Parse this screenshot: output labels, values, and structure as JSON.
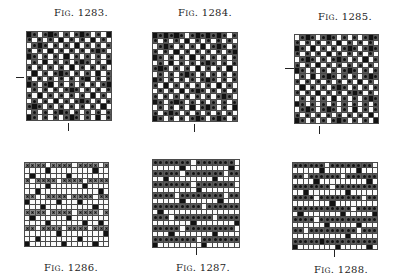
{
  "figures": [
    {
      "id": "1283",
      "caption_prefix": "F",
      "caption_sc": "IG",
      "caption_num": ". 1283.",
      "caption_pos": "top",
      "caption_xy": [
        54,
        7
      ],
      "grid": {
        "x": 26,
        "y": 31,
        "w": 86,
        "h": 90
      },
      "marks": [
        {
          "type": "h",
          "x": 16,
          "y": 77,
          "len": 8
        },
        {
          "type": "v",
          "x": 68,
          "y": 123,
          "len": 8
        }
      ],
      "rows": [
        "bdwdbdwdwdbdwdwb",
        "dwdwdwbwdwdwbwdw",
        "wdbdwdwdwbwdwdwd",
        "dwdwbwdwdwdwdbdw",
        "bdwdwdwbwdwdwdwd",
        "wdwbwdwdwdbdwdwb",
        "dwdwdwdwbwdwdwdw",
        "wbwdwdbdwdwdwbwd",
        "dwdwdwdwdwdbwdwd",
        "bdwdbwdwdwdwdwdb",
        "wdwdwdwdbdwdwdwd",
        "dwbwdwdwdwdwbwdw",
        "wdwdwbwdwdbdwdwd",
        "dbdwdwdwdwdwdwbw",
        "wdwdwdbdwdwdwdwd",
        "bdwdwdwdbdwdwbwd"
      ]
    },
    {
      "id": "1284",
      "caption_prefix": "F",
      "caption_sc": "IG",
      "caption_num": ". 1284.",
      "caption_pos": "top",
      "caption_xy": [
        178,
        7
      ],
      "grid": {
        "x": 152,
        "y": 32,
        "w": 86,
        "h": 90
      },
      "marks": [
        {
          "type": "v",
          "x": 194,
          "y": 124,
          "len": 8
        }
      ],
      "rows": [
        "bdbdbdwdbdbdbdwd",
        "dwdwdwbwdwdwdwdw",
        "wdbdwdwdwbwdbdwd",
        "dwdwbwdwdwdwdwdb",
        "bdwdwdwbwdwdwdwd",
        "wdwbwdwdwdbdwdwd",
        "dbdwdwdwbwdwdwbw",
        "wdwdwdbdwdwdwdwd",
        "bdwdwdwdwdbdwdwd",
        "dwbwdwdwdwdwbwdw",
        "wdwdwbwdbdwdwdwd",
        "dwdwdwdwdwdwdbdw",
        "bdwdbdwdwdwdwdwd",
        "wdwdwdwbwdbdwdwb",
        "dwdbdwdwdwdwdwdw",
        "bdwdwdwdbdwdbdwd"
      ]
    },
    {
      "id": "1285",
      "caption_prefix": "F",
      "caption_sc": "IG",
      "caption_num": ". 1285.",
      "caption_pos": "top",
      "caption_xy": [
        318,
        11
      ],
      "grid": {
        "x": 294,
        "y": 34,
        "w": 85,
        "h": 90
      },
      "marks": [
        {
          "type": "h",
          "x": 285,
          "y": 68,
          "len": 9
        },
        {
          "type": "v",
          "x": 319,
          "y": 126,
          "len": 8
        }
      ],
      "rows": [
        "wdbdwdbdwdwdwdbd",
        "dwdwdwdwbwdwdwdw",
        "bdwbwdwdwdbdwdbd",
        "dwdwdwbwdwdwdwdw",
        "wdbdwdwdbdwdwbwd",
        "dwdwbwdwdwdwdwdw",
        "bdwdwdwdwdbdwdwd",
        "wdwbwdbdwdwdwdbd",
        "dwdwdwdwdwdwbwdw",
        "wbwdwdwdbdwdwdwd",
        "dwdwbwdwdwdbdwdw",
        "wdwdwdwbwdwdwdbd",
        "bdwdwdwdwdwdwdwd",
        "wdbdwdbdwdwbwdwd",
        "dwdwdwdwdwdwdwbw",
        "bdwdwdwdbdwdwdwb"
      ]
    },
    {
      "id": "1286",
      "caption_prefix": "F",
      "caption_sc": "IG",
      "caption_num": ". 1286.",
      "caption_pos": "bottom",
      "caption_xy": [
        44,
        262
      ],
      "grid": {
        "x": 24,
        "y": 162,
        "w": 85,
        "h": 85
      },
      "marks": [],
      "rows": [
        "xxxxwxxxxwxxxxwx",
        "wwwwbwwwwwwwwbww",
        "wbwwwwwwbwwwwwww",
        "xwxxxxwxxxxwxxxx",
        "wwwwbwwwwwwbwwww",
        "wwbwwwwwwwwwwwbw",
        "xxwwxxxxwxxxxwxx",
        "bwwwwwbwwwbwwwww",
        "wwwbwwwwwwwwwbww",
        "xxxxwxxxxwxxxxwx",
        "wbwwwwwwbwwwwwww",
        "wwwwbwwwwwwbwwbw",
        "xxwxxxxwxxxxwxxx",
        "wwwwwwbwwwwwwwwb",
        "wwbwwwwwwwbwwwww",
        "bwwwwwwbwwwwwbww"
      ]
    },
    {
      "id": "1287",
      "caption_prefix": "F",
      "caption_sc": "IG",
      "caption_num": ". 1287.",
      "caption_pos": "bottom",
      "caption_xy": [
        176,
        262
      ],
      "grid": {
        "x": 152,
        "y": 159,
        "w": 88,
        "h": 89
      },
      "marks": [
        {
          "type": "v",
          "x": 196,
          "y": 248,
          "len": 7
        }
      ],
      "rows": [
        "dddddddwdddddddw",
        "wwwwwbwwwwwwwwbw",
        "dddddwdddddddwdd",
        "wwbwwwwwwwwbwwww",
        "dddddddwdddddddw",
        "wwwwwwwwbwwwwwww",
        "ddddwddddddddwdd",
        "wwwwwbwwwwwwbwww",
        "dddddddddwdddddd",
        "wbwwwwwwwwwwwwww",
        "dddwdddddddwdddd",
        "wwwwwwwbwwwwwwwb",
        "dddddwdddddddddw",
        "wwwbwwwwwwwbwwww",
        "ddddddddwddddddd",
        "bwwwwwwwwbwwwwww"
      ]
    },
    {
      "id": "1288",
      "caption_prefix": "F",
      "caption_sc": "IG",
      "caption_num": ". 1288.",
      "caption_pos": "bottom",
      "caption_xy": [
        314,
        264
      ],
      "grid": {
        "x": 292,
        "y": 162,
        "w": 86,
        "h": 88
      },
      "marks": [
        {
          "type": "v",
          "x": 334,
          "y": 250,
          "len": 7
        }
      ],
      "rows": [
        "ddddddwddddddddw",
        "wwwwwbwwwwwwbwww",
        "ddwddddddwdddddd",
        "wwwwbwwwwwwwwwbw",
        "dddddddwdddddddd",
        "wwbwwwwwwwbwwwww",
        "ddddwddddddddwdd",
        "wwwwwwwbwwwwwwww",
        "dddddddddddwdddd",
        "wbwwwwwwwbwwwwwb",
        "ddddwddddddddddd",
        "wwwwwwbwwwwwbwww",
        "ddwdddddddddwddd",
        "wwwwwwwwwwbwwwww",
        "dddddbdddddddddd",
        "bwwwwwwwbwwwwwbw"
      ]
    }
  ]
}
